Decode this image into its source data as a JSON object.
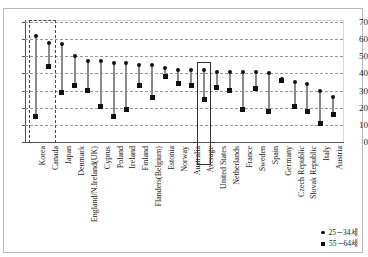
{
  "title": {
    "clipped_text": ""
  },
  "legend": {
    "position": "bottom-right",
    "items": [
      {
        "icon": "circle-marker-icon",
        "label": "25－34세"
      },
      {
        "icon": "square-marker-icon",
        "label": "55－64세"
      }
    ]
  },
  "axes": {
    "y": {
      "ticks": [
        "70",
        "60",
        "50",
        "40",
        "30",
        "20",
        "10",
        "0"
      ],
      "min": 0,
      "max": 70,
      "step": 10,
      "label": ""
    },
    "x": {
      "label": ""
    }
  },
  "highlights": [
    {
      "name": "korea-canada-highlight",
      "style": "dashed",
      "categories": [
        "Korea",
        "Canada"
      ]
    },
    {
      "name": "average-highlight",
      "style": "solid",
      "categories": [
        "Average"
      ]
    }
  ],
  "chart_data": {
    "type": "scatter",
    "subtype": "dumbbell",
    "title": "",
    "xlabel": "",
    "ylabel": "",
    "ylim": [
      0,
      70
    ],
    "grid": true,
    "categories": [
      "Korea",
      "Canada",
      "Japan",
      "Denmark",
      "England/N.Ireland(UK)",
      "Cyprus",
      "Poland",
      "Ireland",
      "Finland",
      "Flanders(Belgium)",
      "Estonia",
      "Norway",
      "Australia",
      "Average",
      "United States",
      "Netherlands",
      "France",
      "Sweden",
      "Spain",
      "Germany",
      "Czech Republic",
      "Slovak Republic",
      "Italy",
      "Austria"
    ],
    "series": [
      {
        "name": "25－34세",
        "marker": "circle",
        "values": [
          62,
          58,
          57,
          50,
          47,
          47,
          46,
          46,
          45,
          45,
          43,
          42,
          42,
          42,
          41,
          41,
          41,
          41,
          40,
          37,
          35,
          34,
          30,
          26
        ]
      },
      {
        "name": "55－64세",
        "marker": "square",
        "values": [
          15,
          44,
          29,
          33,
          30,
          21,
          15,
          19,
          33,
          26,
          38,
          34,
          33,
          25,
          32,
          30,
          19,
          31,
          18,
          36,
          21,
          18,
          11,
          16
        ]
      }
    ]
  }
}
